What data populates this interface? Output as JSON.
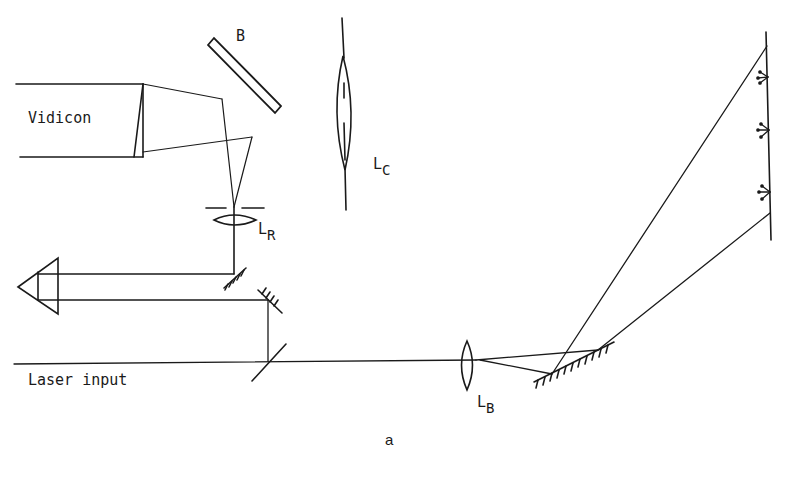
{
  "figure": {
    "caption": "a",
    "labels": {
      "vidicon": "Vidicon",
      "beamsplitter": "B",
      "lens_c": {
        "main": "L",
        "sub": "C"
      },
      "lens_r": {
        "main": "L",
        "sub": "R"
      },
      "lens_b": {
        "main": "L",
        "sub": "B"
      },
      "laser_input": "Laser input"
    }
  },
  "colors": {
    "stroke": "#1a1a1a",
    "background": "#ffffff"
  }
}
